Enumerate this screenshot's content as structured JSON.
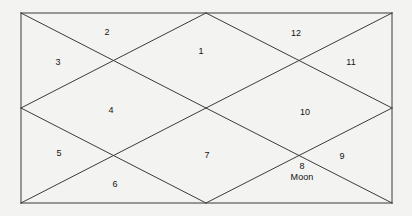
{
  "chart_data": {
    "type": "diagram",
    "title": "",
    "style": "north-indian-vedic-birth-chart",
    "outer_rect": {
      "x": 21,
      "y": 13,
      "width": 371,
      "height": 190
    },
    "stroke_color": "#3b3b3b",
    "background_color": "#f3f3f1",
    "houses": [
      {
        "number": "1",
        "planets": "",
        "x": 201,
        "y": 51
      },
      {
        "number": "2",
        "planets": "",
        "x": 107,
        "y": 32
      },
      {
        "number": "3",
        "planets": "",
        "x": 58,
        "y": 62
      },
      {
        "number": "4",
        "planets": "",
        "x": 111,
        "y": 110
      },
      {
        "number": "5",
        "planets": "",
        "x": 59,
        "y": 153
      },
      {
        "number": "6",
        "planets": "",
        "x": 115,
        "y": 184
      },
      {
        "number": "7",
        "planets": "",
        "x": 207,
        "y": 155
      },
      {
        "number": "8",
        "planets": "Moon",
        "x": 302,
        "y": 172
      },
      {
        "number": "9",
        "planets": "",
        "x": 342,
        "y": 156
      },
      {
        "number": "10",
        "planets": "",
        "x": 305,
        "y": 112
      },
      {
        "number": "11",
        "planets": "",
        "x": 351,
        "y": 62
      },
      {
        "number": "12",
        "planets": "",
        "x": 296,
        "y": 33
      }
    ],
    "lines": [
      {
        "name": "outer-border-top",
        "x1": 21,
        "y1": 13,
        "x2": 392,
        "y2": 13
      },
      {
        "name": "outer-border-right",
        "x1": 392,
        "y1": 13,
        "x2": 392,
        "y2": 203
      },
      {
        "name": "outer-border-bottom",
        "x1": 392,
        "y1": 203,
        "x2": 21,
        "y2": 203
      },
      {
        "name": "outer-border-left",
        "x1": 21,
        "y1": 203,
        "x2": 21,
        "y2": 13
      },
      {
        "name": "diamond-top-left",
        "x1": 21,
        "y1": 108,
        "x2": 206,
        "y2": 13
      },
      {
        "name": "diamond-top-right",
        "x1": 206,
        "y1": 13,
        "x2": 392,
        "y2": 108
      },
      {
        "name": "diamond-bottom-right",
        "x1": 392,
        "y1": 108,
        "x2": 206,
        "y2": 203
      },
      {
        "name": "diamond-bottom-left",
        "x1": 206,
        "y1": 203,
        "x2": 21,
        "y2": 108
      },
      {
        "name": "diagonal-tl-center",
        "x1": 21,
        "y1": 13,
        "x2": 206,
        "y2": 108
      },
      {
        "name": "diagonal-center-br",
        "x1": 206,
        "y1": 108,
        "x2": 392,
        "y2": 203
      },
      {
        "name": "diagonal-tr-center",
        "x1": 392,
        "y1": 13,
        "x2": 206,
        "y2": 108
      },
      {
        "name": "diagonal-center-bl",
        "x1": 206,
        "y1": 108,
        "x2": 21,
        "y2": 203
      }
    ]
  }
}
